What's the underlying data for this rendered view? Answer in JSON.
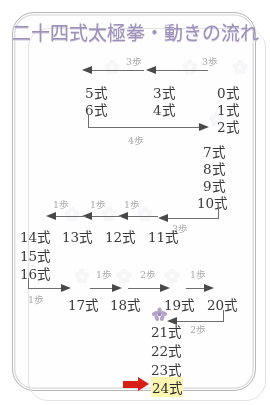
{
  "document": {
    "title": "二十四式太極拳・動きの流れ",
    "title_color": "#9d91b8",
    "frame_color": "#b7b7b7",
    "background_color": "#ffffff"
  },
  "diagram": {
    "type": "flow-diagram",
    "highlight_color": "#fdf6b2",
    "accent_color": "#d81f15",
    "step_label_color": "#a9a9a9",
    "arrow_color": "#4a4a4a",
    "rows": [
      {
        "id": "row-1",
        "nodes": [
          "5式",
          "3式",
          "0式"
        ],
        "steps": [
          "3歩",
          "3歩"
        ],
        "direction": "right-to-left"
      },
      {
        "id": "row-2",
        "nodes": [
          "6式",
          "4式",
          "1式"
        ]
      },
      {
        "id": "row-3",
        "nodes": [
          "2式"
        ]
      },
      {
        "id": "row-4",
        "nodes": [],
        "steps": [
          "4歩"
        ],
        "direction": "left-to-right"
      },
      {
        "id": "right-column",
        "nodes": [
          "7式",
          "8式",
          "9式",
          "10式"
        ]
      },
      {
        "id": "row-5",
        "nodes": [
          "14式",
          "13式",
          "12式",
          "11式"
        ],
        "steps": [
          "1歩",
          "1歩",
          "1歩",
          "3歩"
        ],
        "direction": "right-to-left"
      },
      {
        "id": "left-column",
        "nodes": [
          "15式",
          "16式"
        ]
      },
      {
        "id": "row-6",
        "nodes": [
          "17式",
          "18式",
          "19式",
          "20式"
        ],
        "steps": [
          "1歩",
          "1歩",
          "2歩",
          "1歩"
        ],
        "direction": "left-to-right"
      },
      {
        "id": "row-7",
        "nodes": [
          "21式",
          "22式",
          "23式",
          "24式"
        ],
        "steps": [
          "2歩"
        ],
        "direction": "right-to-left"
      }
    ],
    "nodes": {
      "n0": "0式",
      "n1": "1式",
      "n2": "2式",
      "n3": "3式",
      "n4": "4式",
      "n5": "5式",
      "n6": "6式",
      "n7": "7式",
      "n8": "8式",
      "n9": "9式",
      "n10": "10式",
      "n11": "11式",
      "n12": "12式",
      "n13": "13式",
      "n14": "14式",
      "n15": "15式",
      "n16": "16式",
      "n17": "17式",
      "n18": "18式",
      "n19": "19式",
      "n20": "20式",
      "n21": "21式",
      "n22": "22式",
      "n23": "23式",
      "n24": "24式"
    },
    "steps": {
      "s_top_left": "3歩",
      "s_top_right": "3歩",
      "s_four": "4歩",
      "s_mid_1": "1歩",
      "s_mid_2": "1歩",
      "s_mid_3": "1歩",
      "s_mid_three": "3歩",
      "s_bot_0": "1歩",
      "s_bot_1": "1歩",
      "s_bot_2": "2歩",
      "s_bot_3": "1歩",
      "s_end_two": "2歩"
    }
  }
}
